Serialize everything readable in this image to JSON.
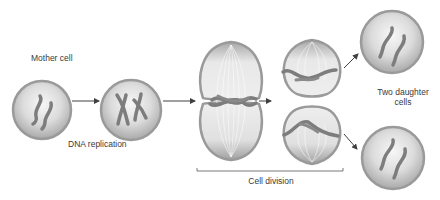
{
  "labels": {
    "mother_cell": "Mother cell",
    "dna_replication": "DNA replication",
    "cell_division": "Cell division",
    "two_daughter_line1": "Two daughter",
    "two_daughter_line2": "cells"
  },
  "colors": {
    "cell_outline": "#9a9a9a",
    "cell_fill_light": "#f4f4f4",
    "cell_fill_dark": "#a8a8a8",
    "chromosome": "#7d7d7d",
    "arrow": "#404040",
    "spindle": "#ffffff"
  },
  "stages": [
    {
      "name": "mother-cell",
      "chromosomes": 2,
      "state": "unreplicated"
    },
    {
      "name": "replicated-cell",
      "chromosomes": 2,
      "state": "X-shaped replicated"
    },
    {
      "name": "metaphase-cell",
      "state": "chromosomes aligned at equator with spindle"
    },
    {
      "name": "anaphase-cell",
      "state": "chromatids separated, cell pinching"
    },
    {
      "name": "daughter-cell-top",
      "chromosomes": 2
    },
    {
      "name": "daughter-cell-bottom",
      "chromosomes": 2
    }
  ]
}
